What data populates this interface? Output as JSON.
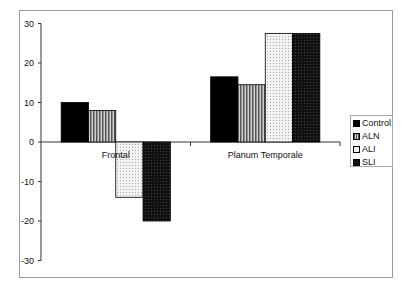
{
  "chart_data": {
    "type": "bar",
    "title": "",
    "xlabel": "",
    "ylabel": "",
    "categories": [
      "Frontal",
      "Planum Temporale"
    ],
    "series": [
      {
        "name": "Control",
        "values": [
          10,
          16.5
        ],
        "fill": "#000000",
        "pattern": "solid"
      },
      {
        "name": "ALN",
        "values": [
          8,
          14.5
        ],
        "fill": "#9a9a9a",
        "pattern": "vertical-stripes"
      },
      {
        "name": "ALI",
        "values": [
          -14,
          27.5
        ],
        "fill": "#e8e8e8",
        "pattern": "dots"
      },
      {
        "name": "SLI",
        "values": [
          -20,
          27.5
        ],
        "fill": "#111111",
        "pattern": "dark-speckle"
      }
    ],
    "ylim": [
      -30,
      30
    ],
    "yticks": [
      30,
      20,
      10,
      0,
      -10,
      -20,
      -30
    ],
    "grid": false,
    "legend_position": "right"
  },
  "legend": {
    "items": [
      "Control",
      "ALN",
      "ALI",
      "SLI"
    ]
  }
}
